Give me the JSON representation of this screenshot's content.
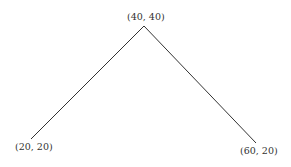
{
  "diagram": {
    "type": "polyline",
    "stroke_color": "#333333",
    "points": [
      {
        "label": "(20, 20)",
        "x": 20,
        "y": 20
      },
      {
        "label": "(40, 40)",
        "x": 40,
        "y": 40
      },
      {
        "label": "(60, 20)",
        "x": 60,
        "y": 20
      }
    ]
  }
}
